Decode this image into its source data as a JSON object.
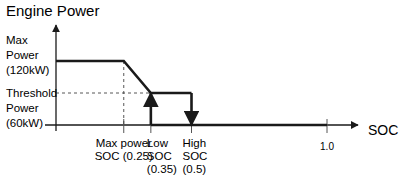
{
  "chart_data": {
    "type": "line",
    "title": "Engine Power",
    "xlabel": "SOC",
    "ylabel": "Engine Power",
    "xlim": [
      0,
      1.0
    ],
    "ylim": [
      0,
      120
    ],
    "grid": false,
    "y_levels": [
      {
        "name": "max_power",
        "value": 120,
        "label_lines": [
          "Max",
          "Power",
          "(120kW)"
        ]
      },
      {
        "name": "threshold_power",
        "value": 60,
        "label_lines": [
          "Threshold",
          "Power",
          "(60kW)"
        ]
      }
    ],
    "x_ticks": [
      {
        "name": "max_power_soc",
        "value": 0.25,
        "label_lines": [
          "Max power",
          "SOC (0.25)"
        ]
      },
      {
        "name": "low_soc",
        "value": 0.35,
        "label_lines": [
          "Low",
          "SOC",
          "(0.35)"
        ]
      },
      {
        "name": "high_soc",
        "value": 0.5,
        "label_lines": [
          "High",
          "SOC",
          "(0.5)"
        ]
      },
      {
        "name": "full_soc",
        "value": 1.0,
        "label_lines": [
          "1.0"
        ]
      }
    ],
    "series": [
      {
        "name": "power_curve",
        "points": [
          [
            0,
            120
          ],
          [
            0.25,
            120
          ],
          [
            0.35,
            60
          ],
          [
            0.5,
            60
          ]
        ]
      },
      {
        "name": "engine_off_line",
        "points": [
          [
            0.35,
            0
          ],
          [
            1.0,
            0
          ]
        ]
      }
    ],
    "transitions": [
      {
        "name": "engine-on-arrow",
        "x": 0.35,
        "from": 0,
        "to": 60,
        "direction": "up"
      },
      {
        "name": "engine-off-arrow",
        "x": 0.5,
        "from": 60,
        "to": 0,
        "direction": "down"
      }
    ],
    "guides": [
      {
        "name": "max-power-soc-guide",
        "x": 0.25,
        "from": 0,
        "to": 120
      },
      {
        "name": "threshold-guide",
        "y": 60,
        "from": 0,
        "to": 0.35
      }
    ]
  }
}
